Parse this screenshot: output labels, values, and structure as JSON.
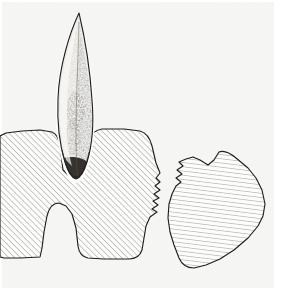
{
  "figure": {
    "domain": "diagram",
    "canvas": {
      "width": 283,
      "height": 290
    },
    "background_color": "#ffffff",
    "paper_tint_color": "#f6f6f4",
    "ink_color": "#1f1f1f",
    "hatch_color": "#7d7d7d",
    "stipple_color": "#555555",
    "blade_fill_color": "#efeeea",
    "blade_shadow_color": "#8e8a82",
    "elements": [
      {
        "id": "projectile-point",
        "label": "Projectile point",
        "description": "Elongated lanceolate stippled blade, tip up, base embedded in notch",
        "render": "stippled",
        "bbox": [
          55,
          12,
          50,
          175
        ]
      },
      {
        "id": "bone-fragment-left",
        "label": "Left bone fragment",
        "description": "Large cross-hatched sectioned element with a V notch receiving the point and a rounded basal notch; serrated fracture edge on the right",
        "render": "diagonal-hatch-45",
        "bbox": [
          0,
          129,
          165,
          130
        ]
      },
      {
        "id": "bone-fragment-right",
        "label": "Right bone fragment",
        "description": "Detached cross-hatched fragment with matching serrated fracture edge on its left side",
        "render": "horizontal-hatch",
        "bbox": [
          165,
          152,
          100,
          120
        ]
      }
    ],
    "hatching": {
      "left_fragment_angle_deg": 45,
      "left_fragment_spacing_px": 4,
      "right_fragment_angle_deg": 7,
      "right_fragment_spacing_px": 4
    },
    "caption": ""
  }
}
